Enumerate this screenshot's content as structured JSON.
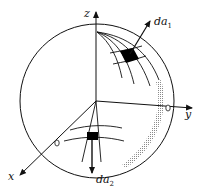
{
  "diagram": {
    "title": "",
    "axes": [
      {
        "id": "z",
        "label": "z"
      },
      {
        "id": "y",
        "label": "y"
      },
      {
        "id": "x",
        "label": "x"
      }
    ],
    "elements": [
      {
        "id": "da1",
        "label_main": "da",
        "label_sub": "1",
        "description": "area element on upper sphere surface with outward normal arrow"
      },
      {
        "id": "da2",
        "label_main": "da",
        "label_sub": "2",
        "description": "area element on lower sphere surface with downward normal arrow"
      }
    ],
    "colors": {
      "stroke": "#111111",
      "patch": "#000000",
      "shading": "#9a9a9a",
      "background": "#ffffff"
    }
  }
}
